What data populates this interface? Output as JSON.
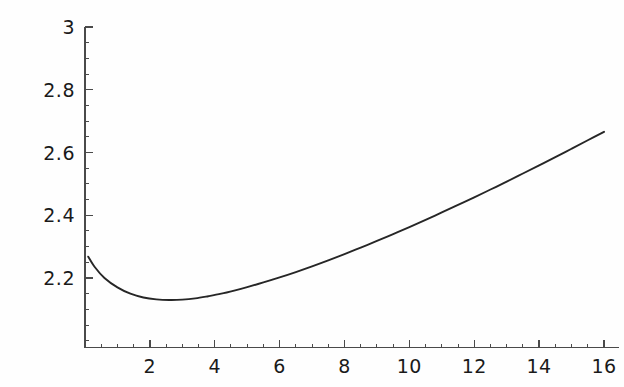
{
  "figure": {
    "background_color": "#fefefe",
    "curve_color": "#262626",
    "axis_color": "#4a4a4a",
    "tick_label_color": "#1a1a1a"
  },
  "chart_data": {
    "type": "line",
    "title": "",
    "subtitle": "",
    "xlabel": "",
    "ylabel": "",
    "xlim": [
      0,
      16.5
    ],
    "ylim": [
      2.0,
      3.0
    ],
    "grid": false,
    "legend": false,
    "legend_position": "none",
    "x_ticks": [
      2,
      4,
      6,
      8,
      10,
      12,
      14,
      16
    ],
    "x_tick_labels": [
      "2",
      "4",
      "6",
      "8",
      "10",
      "12",
      "14",
      "16"
    ],
    "x_minor_tick_step": 0.5,
    "y_ticks": [
      2.2,
      2.4,
      2.6,
      2.8,
      3
    ],
    "y_tick_labels": [
      "2.2",
      "2.4",
      "2.6",
      "2.8",
      "3"
    ],
    "y_minor_tick_step": 0.05,
    "series": [
      {
        "name": "curve",
        "x": [
          0.1,
          0.3,
          0.6,
          1.0,
          1.4,
          1.8,
          2.2,
          2.6,
          3.0,
          3.4,
          3.8,
          4.2,
          4.6,
          5.0,
          5.5,
          6.0,
          6.5,
          7.0,
          7.5,
          8.0,
          8.5,
          9.0,
          9.5,
          10.0,
          10.5,
          11.0,
          11.5,
          12.0,
          12.5,
          13.0,
          13.5,
          14.0,
          14.5,
          15.0,
          15.5,
          16.0
        ],
        "y": [
          2.268,
          2.235,
          2.2,
          2.17,
          2.15,
          2.138,
          2.132,
          2.13,
          2.131,
          2.135,
          2.142,
          2.15,
          2.16,
          2.171,
          2.186,
          2.202,
          2.219,
          2.237,
          2.256,
          2.276,
          2.297,
          2.318,
          2.34,
          2.362,
          2.385,
          2.409,
          2.433,
          2.457,
          2.482,
          2.507,
          2.533,
          2.559,
          2.585,
          2.612,
          2.639,
          2.666
        ]
      }
    ]
  }
}
